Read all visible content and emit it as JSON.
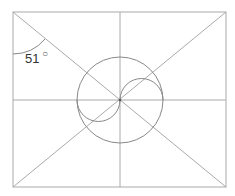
{
  "diagram": {
    "angle_label": "51",
    "degree_symbol": "○",
    "colors": {
      "lines": "#aaaaaa",
      "circles": "#888888",
      "text": "#333333"
    }
  }
}
